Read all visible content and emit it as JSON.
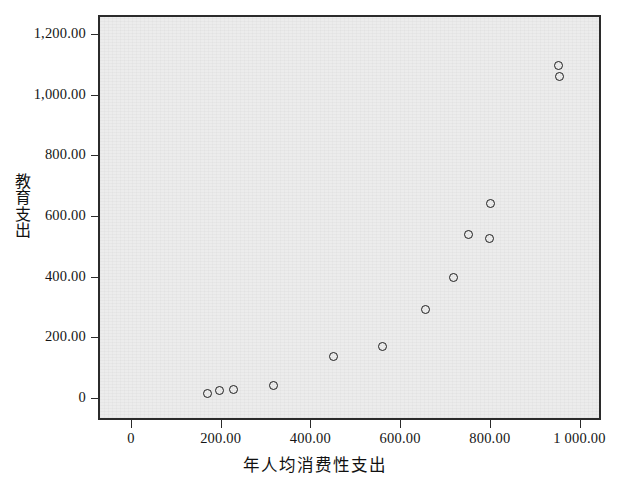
{
  "chart_data": {
    "type": "scatter",
    "title": "",
    "xlabel": "年人均消费性支出",
    "ylabel": "教育支出",
    "xlim": [
      -292,
      830
    ],
    "ylim": [
      -49,
      1286
    ],
    "grid": false,
    "legend": null,
    "xticks": [
      0,
      200,
      400,
      600,
      800,
      1000
    ],
    "xtick_labels": [
      "0",
      "200.00",
      "400.00",
      "600.00",
      "800.00",
      "1 000.00"
    ],
    "yticks": [
      0,
      200,
      400,
      600,
      800,
      1000,
      1200
    ],
    "ytick_labels": [
      "0",
      "200.00",
      "400.00",
      "600.00",
      "800.00",
      "1,000.00",
      "1,200.00"
    ],
    "marker": "open-circle",
    "marker_color": "#1f1f1f",
    "plot_background": "#ececec",
    "points": [
      {
        "x": 165,
        "y": 20
      },
      {
        "x": 192,
        "y": 30
      },
      {
        "x": 225,
        "y": 36
      },
      {
        "x": 314,
        "y": 49
      },
      {
        "x": 446,
        "y": 142
      },
      {
        "x": 557,
        "y": 175
      },
      {
        "x": 653,
        "y": 297
      },
      {
        "x": 715,
        "y": 405
      },
      {
        "x": 749,
        "y": 544
      },
      {
        "x": 794,
        "y": 531
      },
      {
        "x": 798,
        "y": 646
      },
      {
        "x": 950,
        "y": 1065
      },
      {
        "x": 948,
        "y": 1101
      }
    ]
  },
  "ylabel_chars": [
    "教",
    "育",
    "支",
    "出"
  ]
}
